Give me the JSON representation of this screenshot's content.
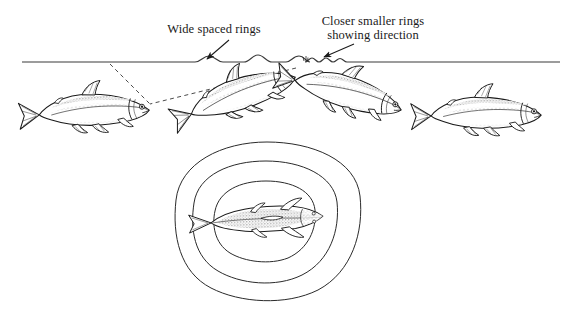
{
  "figure": {
    "kind": "scientific-ink-illustration",
    "background_color": "#ffffff",
    "ink_color": "#1a1a1a",
    "width": 572,
    "height": 319
  },
  "labels": {
    "wide_rings": "Wide spaced rings",
    "close_rings": "Closer smaller rings\nshowing direction"
  },
  "waterline": {
    "y": 62,
    "x_start": 22,
    "x_end": 560,
    "wide_wave_span": [
      195,
      300
    ],
    "close_ripple_span": [
      305,
      346
    ]
  },
  "rings": {
    "count": 3,
    "center": [
      267,
      219
    ],
    "outer_radius_x": 93,
    "outer_radius_y": 77,
    "mid_radius_x": 70,
    "mid_radius_y": 58,
    "inner_radius_x": 48,
    "inner_radius_y": 38
  },
  "fish": [
    {
      "name": "fish-left-submerged",
      "view": "lateral",
      "cx": 95,
      "cy": 109,
      "length": 114,
      "angle": -4,
      "facing": "right"
    },
    {
      "name": "fish-rising-left",
      "view": "lateral",
      "cx": 243,
      "cy": 92,
      "length": 108,
      "angle": -21,
      "facing": "right"
    },
    {
      "name": "fish-rising-right",
      "view": "lateral",
      "cx": 350,
      "cy": 92,
      "length": 106,
      "angle": 14,
      "facing": "right"
    },
    {
      "name": "fish-right-submerged",
      "view": "lateral",
      "cx": 487,
      "cy": 112,
      "length": 112,
      "angle": -2,
      "facing": "right"
    },
    {
      "name": "fish-center-dorsal",
      "view": "dorsal",
      "cx": 267,
      "cy": 220,
      "length": 112,
      "angle": -3,
      "facing": "right"
    }
  ],
  "guides": {
    "dashed_line_count": 2,
    "converge_point": [
      150,
      104
    ],
    "dashed_from_a": [
      110,
      64
    ],
    "dashed_from_b": [
      296,
      68
    ]
  },
  "arrows": [
    {
      "name": "arrow-wide-rings",
      "from": [
        229,
        40
      ],
      "to": [
        206,
        60
      ]
    },
    {
      "name": "arrow-close-rings",
      "from": [
        352,
        44
      ],
      "to": [
        323,
        58
      ]
    }
  ]
}
